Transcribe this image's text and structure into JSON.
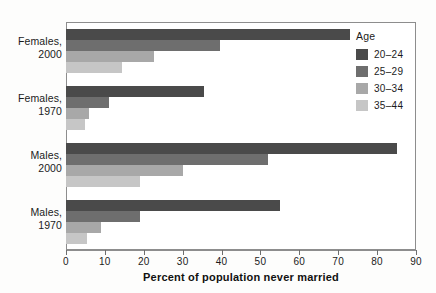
{
  "chart_data": {
    "type": "bar",
    "orientation": "horizontal",
    "grouped": true,
    "title": "",
    "xlabel": "Percent of population never married",
    "ylabel": "",
    "xlim": [
      0,
      90
    ],
    "xticks": [
      0,
      10,
      20,
      30,
      40,
      50,
      60,
      70,
      80,
      90
    ],
    "xticklabels": [
      "0",
      "10",
      "20",
      "30",
      "40",
      "50",
      "60",
      "70",
      "80",
      "90"
    ],
    "grid": false,
    "legend_title": "Age",
    "legend_position": "right",
    "categories": [
      "Females, 2000",
      "Females, 1970",
      "Males, 2000",
      "Males, 1970"
    ],
    "series": [
      {
        "name": "20–24",
        "color": "#4a4a4a",
        "values": [
          73,
          35.5,
          85,
          55
        ]
      },
      {
        "name": "25–29",
        "color": "#6e6e6e",
        "values": [
          39.5,
          11,
          52,
          19
        ]
      },
      {
        "name": "30–34",
        "color": "#a8a8a8",
        "values": [
          22.5,
          6,
          30,
          9
        ]
      },
      {
        "name": "35–44",
        "color": "#c6c6c6",
        "values": [
          14.5,
          5,
          19,
          5.5
        ]
      }
    ]
  },
  "axis": {
    "x_title": "Percent of population never married",
    "ticklabels": [
      "0",
      "10",
      "20",
      "30",
      "40",
      "50",
      "60",
      "70",
      "80",
      "90"
    ]
  },
  "groups": [
    {
      "line1": "Females,",
      "line2": "2000"
    },
    {
      "line1": "Females,",
      "line2": "1970"
    },
    {
      "line1": "Males,",
      "line2": "2000"
    },
    {
      "line1": "Males,",
      "line2": "1970"
    }
  ],
  "legend": {
    "title": "Age",
    "items": [
      {
        "label": "20–24",
        "color": "#4a4a4a"
      },
      {
        "label": "25–29",
        "color": "#6e6e6e"
      },
      {
        "label": "30–34",
        "color": "#a8a8a8"
      },
      {
        "label": "35–44",
        "color": "#c6c6c6"
      }
    ]
  }
}
